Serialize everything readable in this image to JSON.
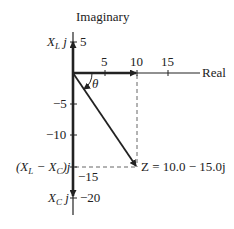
{
  "diagram": {
    "type": "complex-plane-impedance",
    "axes": {
      "vertical_label": "Imaginary",
      "horizontal_label": "Real",
      "real_ticks": [
        "5",
        "10",
        "15"
      ],
      "imag_ticks": [
        "5",
        "−5",
        "−10",
        "−15",
        "−20"
      ]
    },
    "labels": {
      "xl": "X",
      "xl_sub": "L",
      "j": " j",
      "xlxc_open": "(X",
      "xlxc_sub_l": "L",
      "xlxc_mid": " − X",
      "xlxc_sub_c": "C",
      "xlxc_close": ")j",
      "xc": "X",
      "xc_sub": "C",
      "theta": "θ",
      "z_label": "Z = 10.0 − 15.0j"
    },
    "vectors": [
      {
        "name": "X_L j",
        "real": 0,
        "imag": 5
      },
      {
        "name": "R",
        "real": 10,
        "imag": 0
      },
      {
        "name": "(X_L - X_C) j",
        "real": 0,
        "imag": -15
      },
      {
        "name": "X_C j",
        "real": 0,
        "imag": -20
      },
      {
        "name": "Z",
        "real": 10,
        "imag": -15
      }
    ],
    "colors": {
      "ink": "#222222",
      "background": "#ffffff"
    }
  }
}
